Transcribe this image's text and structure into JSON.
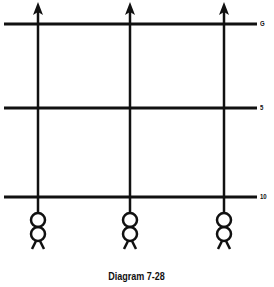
{
  "diagram": {
    "caption": "Diagram 7-28",
    "line_color": "#111111",
    "yard_lines": [
      {
        "label": "G",
        "y": 24
      },
      {
        "label": "5",
        "y": 108
      },
      {
        "label": "10",
        "y": 197
      }
    ],
    "routes": [
      {
        "x": 38,
        "direction": "up",
        "ends_in": "arrow-icon"
      },
      {
        "x": 130,
        "direction": "up",
        "ends_in": "arrow-icon"
      },
      {
        "x": 224,
        "direction": "up",
        "ends_in": "arrow-icon"
      }
    ],
    "players": [
      {
        "x": 38,
        "symbol": "player-icon"
      },
      {
        "x": 130,
        "symbol": "player-icon"
      },
      {
        "x": 224,
        "symbol": "player-icon"
      }
    ]
  }
}
